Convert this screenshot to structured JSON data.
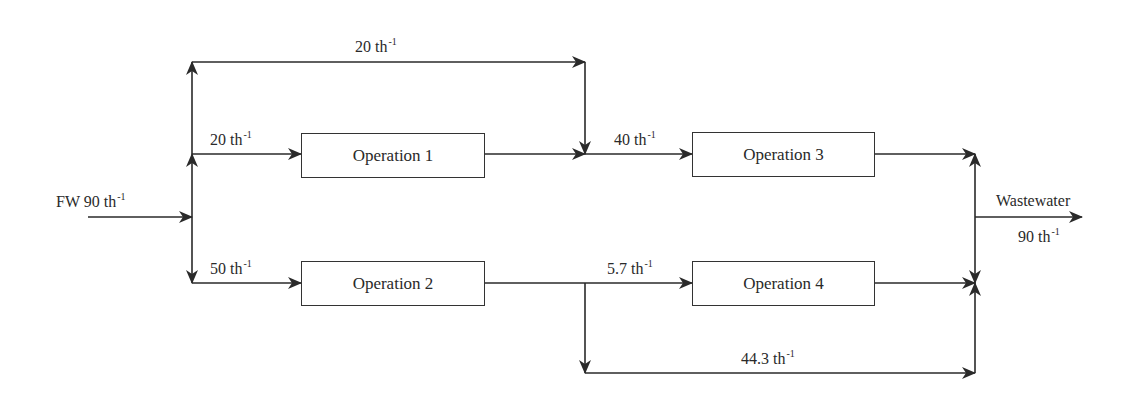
{
  "diagram": {
    "type": "process-flow",
    "unit": "t h⁻¹",
    "operations": [
      {
        "id": "op1",
        "label": "Operation 1"
      },
      {
        "id": "op2",
        "label": "Operation 2"
      },
      {
        "id": "op3",
        "label": "Operation 3"
      },
      {
        "id": "op4",
        "label": "Operation 4"
      }
    ],
    "flows": {
      "freshwater": {
        "prefix": "FW 90 th",
        "sup": "-1",
        "value": 90
      },
      "bypass_top": {
        "text": "20 th",
        "sup": "-1",
        "value": 20
      },
      "to_op1": {
        "text": "20 th",
        "sup": "-1",
        "value": 20
      },
      "to_op2": {
        "text": "50 th",
        "sup": "-1",
        "value": 50
      },
      "to_op3": {
        "text": "40 th",
        "sup": "-1",
        "value": 40
      },
      "to_op4": {
        "text": "5.7 th",
        "sup": "-1",
        "value": 5.7
      },
      "bypass_bottom": {
        "text": "44.3 th",
        "sup": "-1",
        "value": 44.3
      },
      "wastewater": {
        "title": "Wastewater",
        "text": "90 th",
        "sup": "-1",
        "value": 90
      }
    },
    "colors": {
      "line": "#2a2a2a",
      "box_border": "#333333",
      "background": "#ffffff"
    }
  }
}
